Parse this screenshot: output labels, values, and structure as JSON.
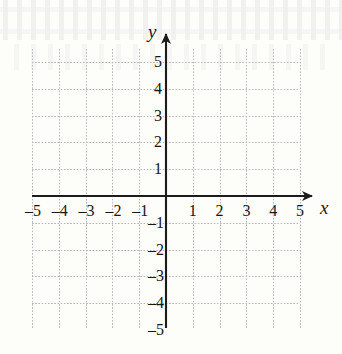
{
  "figure": {
    "kind": "blank-cartesian-coordinate-plane",
    "paper_color": "#fdfdfa",
    "grid_color": "#b9b9bd",
    "axis_color": "#1c1c1c",
    "label_color": "#161616"
  },
  "axes": {
    "x_name": "x",
    "y_name": "x_placeholder",
    "y_name_text": "y",
    "x_arrow": "arrow-right",
    "y_arrow": "arrow-up"
  },
  "chart_data": {
    "type": "scatter",
    "title": "",
    "subtitle": "",
    "xlabel": "x",
    "ylabel": "y",
    "xlim": [
      -5,
      5
    ],
    "ylim": [
      -5,
      5
    ],
    "grid": true,
    "legend": null,
    "legend_position": "none",
    "series": [],
    "annotations": [],
    "x_ticks": [
      -5,
      -4,
      -3,
      -2,
      -1,
      1,
      2,
      3,
      4,
      5
    ],
    "y_ticks": [
      5,
      4,
      3,
      2,
      1,
      -1,
      -2,
      -3,
      -4,
      -5
    ],
    "x_tick_labels": [
      "–5",
      "–4",
      "–3",
      "–2",
      "–1",
      "1",
      "2",
      "3",
      "4",
      "5"
    ],
    "y_tick_labels": [
      "5",
      "4",
      "3",
      "2",
      "1",
      "–1",
      "–2",
      "–3",
      "–4",
      "–5"
    ]
  },
  "ticks": {
    "x_negative": [
      {
        "label": "–5",
        "value": -5
      },
      {
        "label": "–4",
        "value": -4
      },
      {
        "label": "–3",
        "value": -3
      },
      {
        "label": "–2",
        "value": -2
      },
      {
        "label": "–1",
        "value": -1
      }
    ],
    "x_positive": [
      {
        "label": "1",
        "value": 1
      },
      {
        "label": "2",
        "value": 2
      },
      {
        "label": "3",
        "value": 3
      },
      {
        "label": "4",
        "value": 4
      },
      {
        "label": "5",
        "value": 5
      }
    ],
    "y_positive": [
      {
        "label": "5",
        "value": 5
      },
      {
        "label": "4",
        "value": 4
      },
      {
        "label": "3",
        "value": 3
      },
      {
        "label": "2",
        "value": 2
      },
      {
        "label": "1",
        "value": 1
      }
    ],
    "y_negative": [
      {
        "label": "–1",
        "value": -1
      },
      {
        "label": "–2",
        "value": -2
      },
      {
        "label": "–3",
        "value": -3
      },
      {
        "label": "–4",
        "value": -4
      },
      {
        "label": "–5",
        "value": -5
      }
    ]
  }
}
